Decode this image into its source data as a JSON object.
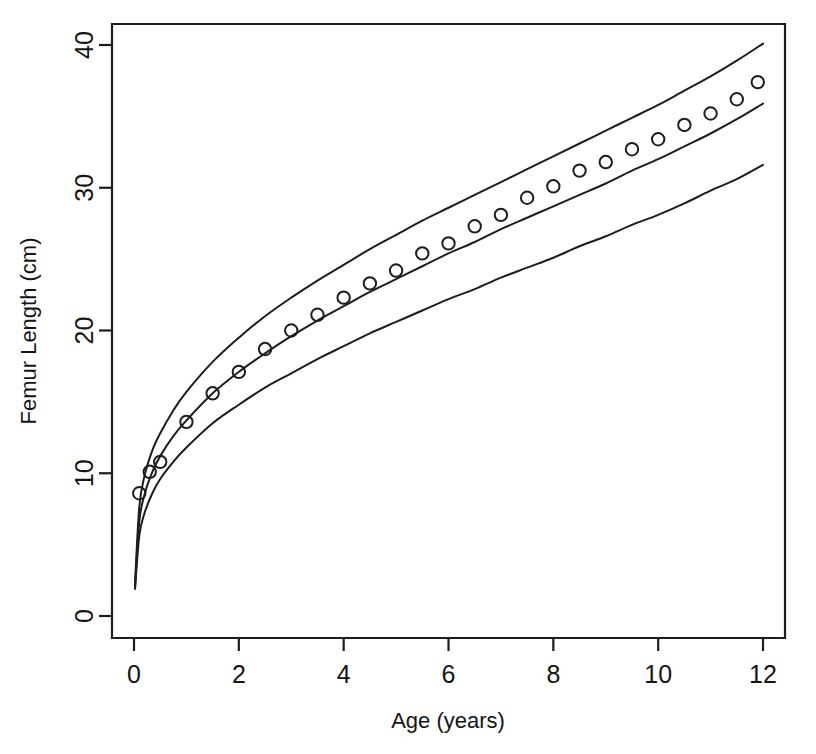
{
  "chart_data": {
    "type": "scatter",
    "title": "",
    "xlabel": "Age (years)",
    "ylabel": "Femur Length (cm)",
    "xlim": [
      -0.2,
      12.4
    ],
    "ylim": [
      -1.4,
      42.5
    ],
    "xticks": [
      0,
      2,
      4,
      6,
      8,
      10,
      12
    ],
    "xticklabels": [
      "0",
      "2",
      "4",
      "6",
      "8",
      "10",
      "12"
    ],
    "yticks": [
      0,
      10,
      20,
      30,
      40
    ],
    "yticklabels": [
      "0",
      "10",
      "20",
      "30",
      "40"
    ],
    "grid": false,
    "legend": null,
    "box": true,
    "marker": "open-circle",
    "points": {
      "name": "Observed mean femur length",
      "x": [
        0.1,
        0.3,
        0.5,
        1.0,
        1.5,
        2.0,
        2.5,
        3.0,
        3.5,
        4.0,
        4.5,
        5.0,
        5.5,
        6.0,
        6.5,
        7.0,
        7.5,
        8.0,
        8.5,
        9.0,
        9.5,
        10.0,
        10.5,
        11.0,
        11.5,
        11.9
      ],
      "y": [
        8.6,
        10.1,
        10.8,
        13.6,
        15.6,
        17.1,
        18.7,
        20.0,
        21.1,
        22.3,
        23.3,
        24.2,
        25.4,
        26.1,
        27.3,
        28.1,
        29.3,
        30.1,
        31.2,
        31.8,
        32.7,
        33.4,
        34.4,
        35.2,
        36.2,
        37.4,
        38.2,
        38.9
      ]
    },
    "series": [
      {
        "name": "upper percentile curve",
        "x": [
          0.02,
          0.1,
          0.2,
          0.35,
          0.5,
          0.75,
          1.0,
          1.5,
          2.0,
          2.5,
          3.0,
          3.5,
          4.0,
          4.5,
          5.0,
          5.5,
          6.0,
          6.5,
          7.0,
          7.5,
          8.0,
          8.5,
          9.0,
          9.5,
          10.0,
          10.5,
          11.0,
          11.5,
          12.0
        ],
        "y": [
          2.3,
          7.6,
          9.8,
          11.6,
          12.8,
          14.4,
          15.7,
          17.8,
          19.5,
          21.0,
          22.3,
          23.5,
          24.6,
          25.7,
          26.7,
          27.7,
          28.6,
          29.5,
          30.4,
          31.3,
          32.2,
          33.1,
          34.0,
          34.9,
          35.8,
          36.8,
          37.8,
          38.9,
          40.1
        ]
      },
      {
        "name": "median curve",
        "x": [
          0.02,
          0.1,
          0.2,
          0.35,
          0.5,
          0.75,
          1.0,
          1.5,
          2.0,
          2.5,
          3.0,
          3.5,
          4.0,
          4.5,
          5.0,
          5.5,
          6.0,
          6.5,
          7.0,
          7.5,
          8.0,
          8.5,
          9.0,
          9.5,
          10.0,
          10.5,
          11.0,
          11.5,
          12.0
        ],
        "y": [
          2.1,
          6.6,
          8.5,
          10.1,
          11.2,
          12.6,
          13.7,
          15.6,
          17.1,
          18.4,
          19.6,
          20.7,
          21.7,
          22.7,
          23.6,
          24.5,
          25.4,
          26.2,
          27.1,
          27.9,
          28.7,
          29.5,
          30.3,
          31.2,
          32.0,
          32.9,
          33.8,
          34.8,
          35.9
        ]
      },
      {
        "name": "lower percentile curve",
        "x": [
          0.02,
          0.1,
          0.2,
          0.35,
          0.5,
          0.75,
          1.0,
          1.5,
          2.0,
          2.5,
          3.0,
          3.5,
          4.0,
          4.5,
          5.0,
          5.5,
          6.0,
          6.5,
          7.0,
          7.5,
          8.0,
          8.5,
          9.0,
          9.5,
          10.0,
          10.5,
          11.0,
          11.5,
          12.0
        ],
        "y": [
          1.9,
          5.6,
          7.2,
          8.6,
          9.6,
          10.8,
          11.8,
          13.5,
          14.8,
          16.0,
          17.0,
          18.0,
          18.9,
          19.8,
          20.6,
          21.4,
          22.2,
          22.9,
          23.7,
          24.4,
          25.1,
          25.9,
          26.6,
          27.4,
          28.1,
          28.9,
          29.8,
          30.6,
          31.6
        ]
      }
    ]
  },
  "colors": {
    "ink": "#1d1d1d",
    "background": "#ffffff"
  }
}
